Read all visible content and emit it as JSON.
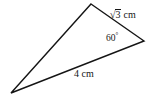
{
  "figure": {
    "type": "triangle-geometry-diagram",
    "background_color": "#ffffff",
    "stroke_color": "#151515",
    "stroke_width": 1.4,
    "vertices": {
      "apex": {
        "x": 91,
        "y": 4
      },
      "right": {
        "x": 144,
        "y": 41
      },
      "left": {
        "x": 11,
        "y": 93
      }
    },
    "labels": {
      "side_upper_right": {
        "radical_symbol": "√",
        "radicand": "3",
        "unit": "cm",
        "full_text": "√3 cm"
      },
      "angle_right_vertex": {
        "value": "60",
        "degree_symbol": "°",
        "full_text": "60°"
      },
      "side_bottom": {
        "value": "4",
        "unit": "cm",
        "full_text": "4 cm"
      }
    }
  }
}
